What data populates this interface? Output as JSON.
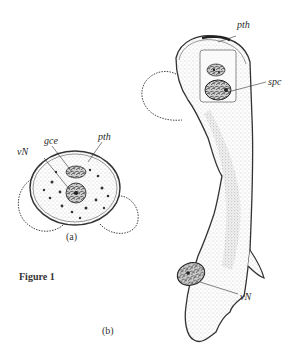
{
  "figure": {
    "title": "Figure 1",
    "panels": [
      {
        "id": "a",
        "caption": "(a)",
        "labels": [
          "gce",
          "pth",
          "vN"
        ]
      },
      {
        "id": "b",
        "caption": "(b)",
        "labels": [
          "pth",
          "spc",
          "vN"
        ]
      }
    ]
  },
  "labels": {
    "a_gce": "gce",
    "a_pth": "pth",
    "a_vN": "vN",
    "b_pth": "pth",
    "b_spc": "spc",
    "b_vN": "vN"
  },
  "captions": {
    "a": "(a)",
    "b": "(b)"
  },
  "colors": {
    "ink": "#2a2a2a",
    "stipple": "#9a9a9a",
    "background": "#ffffff"
  }
}
